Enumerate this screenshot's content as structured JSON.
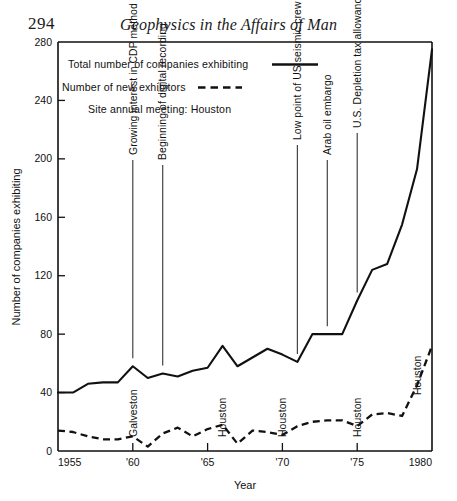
{
  "page": {
    "number": "294",
    "running_head": "Geophysics in the Affairs of Man"
  },
  "chart_data": {
    "type": "line",
    "title": "",
    "xlabel": "Year",
    "ylabel": "Number of companies exhibiting",
    "xlim": [
      1955,
      1980
    ],
    "ylim": [
      0,
      280
    ],
    "grid": false,
    "legend_position": "top-left",
    "x_ticks": [
      1955,
      1960,
      1965,
      1970,
      1975,
      1980
    ],
    "x_tick_labels": [
      "1955",
      "'60",
      "'65",
      "'70",
      "'75",
      "1980"
    ],
    "y_ticks": [
      0,
      40,
      80,
      120,
      160,
      200,
      240,
      280
    ],
    "y_tick_labels": [
      "0",
      "40",
      "80",
      "120",
      "160",
      "200",
      "240",
      "280"
    ],
    "x": [
      1955,
      1956,
      1957,
      1958,
      1959,
      1960,
      1961,
      1962,
      1963,
      1964,
      1965,
      1966,
      1967,
      1968,
      1969,
      1970,
      1971,
      1972,
      1973,
      1974,
      1975,
      1976,
      1977,
      1978,
      1979,
      1980
    ],
    "series": [
      {
        "name": "Total number of companies exhibiting",
        "style": "solid",
        "values": [
          40,
          40,
          46,
          47,
          47,
          58,
          50,
          53,
          51,
          55,
          57,
          72,
          58,
          64,
          70,
          66,
          61,
          80,
          80,
          80,
          103,
          124,
          128,
          155,
          193,
          275
        ]
      },
      {
        "name": "Number of new exhibitors",
        "style": "dashed",
        "values": [
          14,
          13,
          10,
          8,
          8,
          10,
          3,
          12,
          16,
          10,
          15,
          18,
          5,
          14,
          13,
          11,
          17,
          20,
          21,
          21,
          17,
          25,
          26,
          24,
          45,
          72
        ]
      }
    ],
    "annotations": [
      {
        "label": "Growing interest in CDP method",
        "x": 1960
      },
      {
        "label": "Beginning of digital recording",
        "x": 1962
      },
      {
        "label": "Low point of US seismic crew activity",
        "x": 1971
      },
      {
        "label": "Arab oil embargo",
        "x": 1973
      },
      {
        "label": "U.S. Depletion tax allowance removed",
        "x": 1975
      }
    ],
    "site_labels": [
      {
        "label": "Galveston",
        "x": 1960
      },
      {
        "label": "Houston",
        "x": 1966
      },
      {
        "label": "Houston",
        "x": 1970
      },
      {
        "label": "Houston",
        "x": 1975
      },
      {
        "label": "Houston",
        "x": 1979
      }
    ],
    "legend": [
      {
        "label": "Total number of companies exhibiting",
        "style": "solid"
      },
      {
        "label": "Number of new exhibitors",
        "style": "dashed"
      },
      {
        "label": "Site annual meeting: Houston",
        "style": "none"
      }
    ]
  },
  "colors": {
    "ink": "#111111",
    "paper": "#ffffff"
  }
}
